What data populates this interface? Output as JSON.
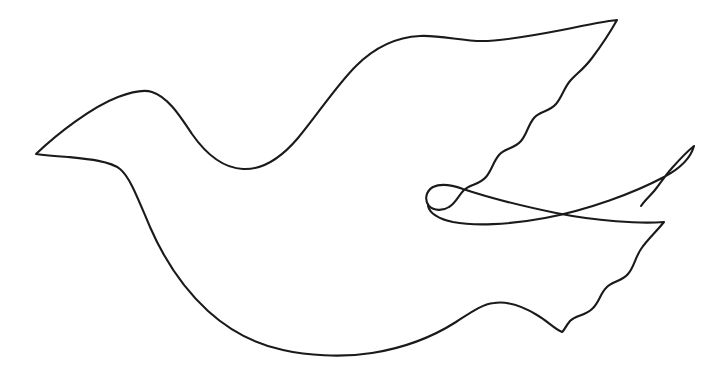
{
  "document": {
    "title": "Dove Outline Line Drawing",
    "background_color": "#ffffff",
    "width": 721,
    "height": 369
  },
  "artwork": {
    "name": "dove-outline",
    "subject": "dove",
    "style": "single-line contour outline, no fill",
    "stroke_color": "#1a1a1a",
    "stroke_width": 2.1,
    "fill": "none",
    "shapes": [
      {
        "name": "dove-body-outline",
        "description": "Closed contour: beak, head, neck, back, upper wing with scalloped trailing edge, tail, belly",
        "key_points": {
          "beak_tip": [
            36,
            154
          ],
          "head_crown": [
            150,
            92
          ],
          "neck_valley": [
            246,
            169
          ],
          "back_shoulder": [
            430,
            37
          ],
          "upper_wing_tip": [
            617,
            20
          ],
          "wing_notch_left": [
            428,
            204
          ],
          "lower_wing_tip": [
            694,
            145
          ],
          "tail_bump_peak": [
            487,
            303
          ],
          "tail_valley": [
            562,
            332
          ],
          "belly_bottom": [
            325,
            352
          ]
        }
      },
      {
        "name": "lower-wing-outline",
        "description": "Swept lower wing: smooth leading edge rising to tip, scalloped trailing edge descending to tail",
        "key_points": {
          "notch_tip": [
            428,
            204
          ],
          "wing_tip": [
            694,
            145
          ]
        }
      }
    ],
    "scallop_counts": {
      "upper_wing_trailing_edge": 5,
      "lower_wing_trailing_edge": 5
    }
  }
}
